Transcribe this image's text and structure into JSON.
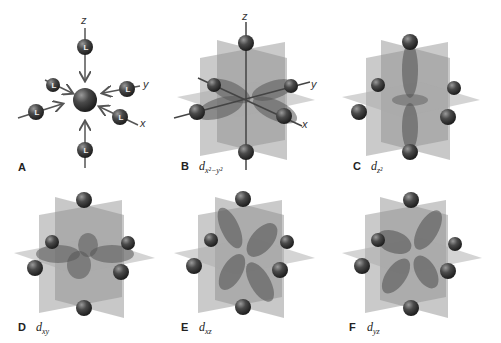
{
  "figure": {
    "colors": {
      "sphere": "#3a3a3a",
      "sphere_highlight": "#8a8a8a",
      "plane": "#9a9a9a",
      "lobe": "#6e6e6e",
      "axis": "#555555",
      "text": "#222222"
    },
    "axes": {
      "x": "x",
      "y": "y",
      "z": "z"
    },
    "ligand_symbol": "L",
    "panels": [
      {
        "id": "A",
        "letter": "A",
        "orbital": "",
        "subscript": "",
        "description": "Six ligands (L) approaching central metal along ±x, ±y, ±z"
      },
      {
        "id": "B",
        "letter": "B",
        "orbital": "d",
        "subscript": "x²−y²",
        "description": "Lobes along x and y axes, pointing at ligands"
      },
      {
        "id": "C",
        "letter": "C",
        "orbital": "d",
        "subscript": "z²",
        "description": "Lobes along z axis with torus in xy plane"
      },
      {
        "id": "D",
        "letter": "D",
        "orbital": "d",
        "subscript": "xy",
        "description": "Lobes between x and y axes"
      },
      {
        "id": "E",
        "letter": "E",
        "orbital": "d",
        "subscript": "xz",
        "description": "Lobes between x and z axes"
      },
      {
        "id": "F",
        "letter": "F",
        "orbital": "d",
        "subscript": "yz",
        "description": "Lobes between y and z axes"
      }
    ]
  }
}
